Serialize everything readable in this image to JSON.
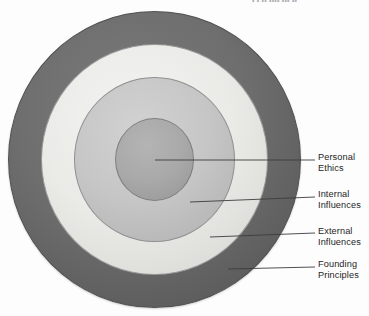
{
  "page": {
    "header_sliver_text": "• • •• •••• ••• ••",
    "background_color": "#ffffff",
    "text_color": "#1d1d1d",
    "leader_line_color": "#3c3c3c"
  },
  "diagram": {
    "type": "concentric-rings",
    "title": "",
    "center": {
      "x": 154,
      "y": 159
    },
    "rings": [
      {
        "id": "founding-principles",
        "label_line_1": "Founding",
        "label_line_2": "Principles",
        "level": 4,
        "position": "outermost",
        "fill_color": "#6e6e6e",
        "stroke_color": "#4f4f4f",
        "outer_radius": 146,
        "inner_radius": 113
      },
      {
        "id": "external-influences",
        "label_line_1": "External",
        "label_line_2": "Influences",
        "level": 3,
        "position": "third",
        "fill_color": "#eaeae7",
        "stroke_color": "#9a9a9a",
        "outer_radius": 113,
        "inner_radius": 81
      },
      {
        "id": "internal-influences",
        "label_line_1": "Internal",
        "label_line_2": "Influences",
        "level": 2,
        "position": "second",
        "fill_color": "#c6c6c6",
        "stroke_color": "#8f8f8f",
        "outer_radius": 81,
        "inner_radius": 40
      },
      {
        "id": "personal-ethics",
        "label_line_1": "Personal",
        "label_line_2": "Ethics",
        "level": 1,
        "position": "center",
        "fill_color": "#a9a9a9",
        "stroke_color": "#7e7e7e",
        "outer_radius": 40,
        "inner_radius": 0
      }
    ]
  },
  "callouts": {
    "personal_ethics": {
      "line_1": "Personal",
      "line_2": "Ethics"
    },
    "internal_influences": {
      "line_1": "Internal",
      "line_2": "Influences"
    },
    "external_influences": {
      "line_1": "External",
      "line_2": "Influences"
    },
    "founding_principles": {
      "line_1": "Founding",
      "line_2": "Principles"
    }
  }
}
